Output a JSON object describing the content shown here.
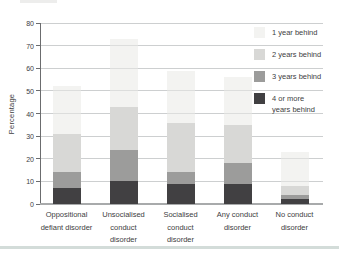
{
  "figure": {
    "ylabel": "Percentage"
  },
  "chart_data": {
    "type": "bar",
    "stacked": true,
    "title": "",
    "xlabel": "",
    "ylabel": "Percentage",
    "ylim": [
      0,
      80
    ],
    "yticks": [
      0,
      10,
      20,
      30,
      40,
      50,
      60,
      70,
      80
    ],
    "grid": true,
    "legend_position": "top-right",
    "categories": [
      "Oppositional defiant disorder",
      "Unsocialised conduct disorder",
      "Socialised conduct disorder",
      "Any conduct disorder",
      "No conduct disorder"
    ],
    "category_lines": [
      [
        "Oppositional",
        "defiant disorder"
      ],
      [
        "Unsocialised",
        "conduct",
        "disorder"
      ],
      [
        "Socialised",
        "conduct",
        "disorder"
      ],
      [
        "Any conduct",
        "disorder"
      ],
      [
        "No conduct",
        "disorder"
      ]
    ],
    "series": [
      {
        "name": "4 or more years behind",
        "color": "#414042",
        "values": [
          7,
          10,
          9,
          9,
          2
        ]
      },
      {
        "name": "3 years behind",
        "color": "#9c9c9b",
        "values": [
          7,
          14,
          5,
          9,
          2
        ]
      },
      {
        "name": "2 years behind",
        "color": "#d8d8d6",
        "values": [
          17,
          19,
          22,
          17,
          4
        ]
      },
      {
        "name": "1 year behind",
        "color": "rgba(233,233,229,0.55)",
        "values": [
          21,
          30,
          23,
          21,
          15
        ]
      }
    ],
    "cumulative_tops": {
      "Oppositional defiant disorder": [
        7,
        14,
        31,
        52
      ],
      "Unsocialised conduct disorder": [
        10,
        24,
        43,
        73
      ],
      "Socialised conduct disorder": [
        9,
        14,
        36,
        59
      ],
      "Any conduct disorder": [
        9,
        18,
        35,
        56
      ],
      "No conduct disorder": [
        2,
        4,
        8,
        23
      ]
    },
    "legend": [
      {
        "label": "1 year behind",
        "color": "rgba(233,233,229,0.55)"
      },
      {
        "label": "2 years behind",
        "color": "#d8d8d6"
      },
      {
        "label": "3 years behind",
        "color": "#9c9c9b"
      },
      {
        "label": "4 or more\nyears behind",
        "color": "#414042"
      }
    ],
    "colors": {
      "axis": "#6b6c6e",
      "baseline": "#a8aaab",
      "gridline": "#cdcfd0",
      "text": "#404041",
      "bottom_rule": "#d3dcd9"
    }
  }
}
